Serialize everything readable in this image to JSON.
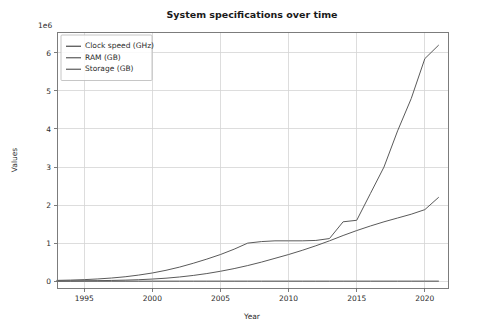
{
  "figure": {
    "background_color": "#ffffff",
    "width": 481,
    "height": 332
  },
  "chart_data": {
    "type": "line",
    "title": "System specifications over time",
    "xlabel": "Year",
    "ylabel": "Values",
    "y_offset_text": "1e6",
    "y_offset_multiplier": 1000000,
    "xlim": [
      1993.0,
      2021.7
    ],
    "ylim": [
      -180000,
      6550000
    ],
    "xticks": [
      1995,
      2000,
      2005,
      2010,
      2015,
      2020
    ],
    "xticklabels": [
      "1995",
      "2000",
      "2005",
      "2010",
      "2015",
      "2020"
    ],
    "yticks": [
      0,
      1000000,
      2000000,
      3000000,
      4000000,
      5000000,
      6000000
    ],
    "yticklabels": [
      "0",
      "1",
      "2",
      "3",
      "4",
      "5",
      "6"
    ],
    "grid": true,
    "legend_position": "upper left",
    "x": [
      1993,
      1994,
      1995,
      1996,
      1997,
      1998,
      1999,
      2000,
      2001,
      2002,
      2003,
      2004,
      2005,
      2006,
      2007,
      2008,
      2009,
      2010,
      2011,
      2012,
      2013,
      2014,
      2015,
      2016,
      2017,
      2018,
      2019,
      2020,
      2021
    ],
    "series": [
      {
        "name": "Clock speed (GHz)",
        "color": "#4a4a4a",
        "values": [
          0.06,
          0.075,
          0.1,
          0.15,
          0.2,
          0.3,
          0.45,
          0.8,
          1.2,
          1.8,
          2.4,
          3.0,
          3.2,
          3.2,
          3.0,
          2.9,
          2.93,
          3.0,
          3.1,
          3.2,
          3.3,
          3.4,
          3.5,
          3.6,
          3.7,
          3.8,
          3.9,
          4.0,
          4.1
        ]
      },
      {
        "name": "RAM (GB)",
        "color": "#5a5a5a",
        "values": [
          4000,
          6000,
          9000,
          13000,
          19000,
          27000,
          38000,
          55000,
          78000,
          110000,
          150000,
          200000,
          260000,
          330000,
          410000,
          500000,
          600000,
          700000,
          810000,
          930000,
          1060000,
          1200000,
          1330000,
          1450000,
          1560000,
          1660000,
          1760000,
          1880000,
          2200000
        ]
      },
      {
        "name": "Storage (GB)",
        "color": "#5a5a5a",
        "values": [
          20000,
          28000,
          40000,
          58000,
          82000,
          115000,
          160000,
          215000,
          285000,
          370000,
          470000,
          580000,
          700000,
          840000,
          1000000,
          1040000,
          1060000,
          1060000,
          1060000,
          1070000,
          1120000,
          1560000,
          1600000,
          2300000,
          3000000,
          3950000,
          4800000,
          5850000,
          6200000
        ]
      }
    ]
  }
}
